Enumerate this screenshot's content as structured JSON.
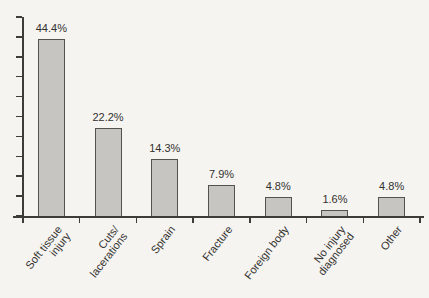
{
  "figure": {
    "background_color": "#f5f4f1"
  },
  "chart_data": {
    "type": "bar",
    "title": "",
    "xlabel": "",
    "ylabel": "",
    "categories": [
      "Soft tissue\ninjury",
      "Cuts/\nlacerations",
      "Sprain",
      "Fracture",
      "Foreign body",
      "No injury\ndiagnosed",
      "Other"
    ],
    "values": [
      44.4,
      22.2,
      14.3,
      7.9,
      4.8,
      1.6,
      4.8
    ],
    "value_labels": [
      "44.4%",
      "22.2%",
      "14.3%",
      "7.9%",
      "4.8%",
      "1.6%",
      "4.8%"
    ],
    "ylim": [
      0,
      50
    ],
    "y_tick_step": 5,
    "y_tick_labels_visible": false,
    "grid": false,
    "legend": "none",
    "label_rotation_deg": 52,
    "colors": {
      "bar_fill": "#c7c5c2",
      "bar_border": "#54524f",
      "axis": "#3e3c39",
      "text": "#33312e"
    }
  }
}
